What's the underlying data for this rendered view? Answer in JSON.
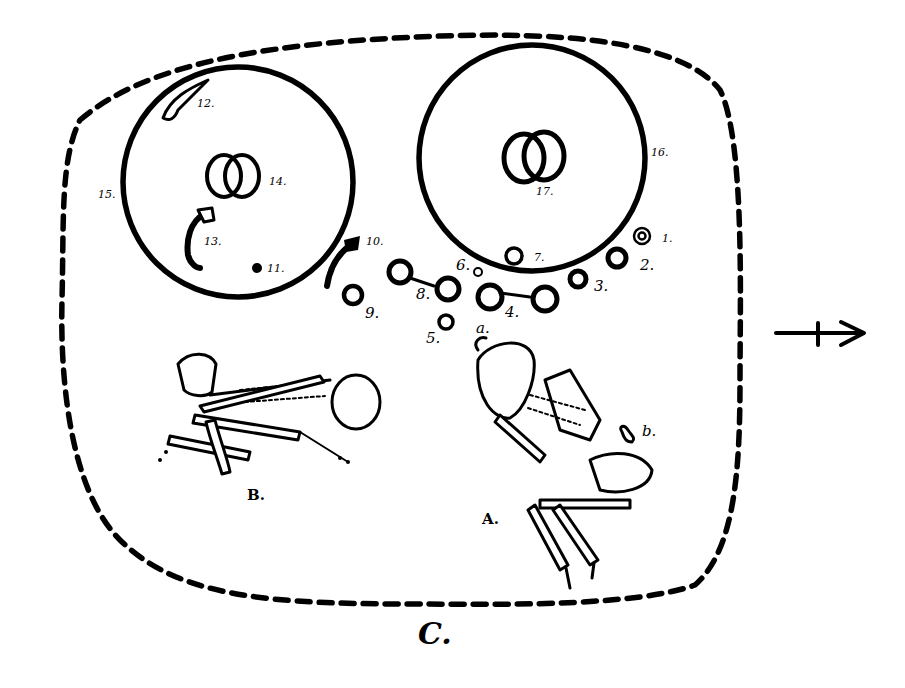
{
  "diagram": {
    "type": "archaeological burial plan",
    "colors": {
      "ink": "#000000",
      "paper": "#ffffff"
    },
    "enclosure": {
      "label": "C."
    },
    "direction_arrow": {
      "icon": "arrow-right-crossed",
      "glyph": "→"
    },
    "circles": [
      {
        "id": "15",
        "label": "15.",
        "content_label": "14.",
        "content": "interlocking rings"
      },
      {
        "id": "16",
        "label": "16.",
        "content_label": "17.",
        "content": "interlocking rings"
      }
    ],
    "finds": [
      {
        "num": "1.",
        "shape": "double ring"
      },
      {
        "num": "2.",
        "shape": "ring"
      },
      {
        "num": "3.",
        "shape": "ring"
      },
      {
        "num": "4.",
        "shape": "linked rings"
      },
      {
        "num": "5.",
        "shape": "ring"
      },
      {
        "num": "6.",
        "shape": "small ring"
      },
      {
        "num": "7.",
        "shape": "ring"
      },
      {
        "num": "8.",
        "shape": "linked rings"
      },
      {
        "num": "9.",
        "shape": "ring"
      },
      {
        "num": "10.",
        "shape": "curved object"
      },
      {
        "num": "11.",
        "shape": "small disc"
      },
      {
        "num": "12.",
        "shape": "curved object"
      },
      {
        "num": "13.",
        "shape": "curved object"
      }
    ],
    "skeletons": [
      {
        "label": "A.",
        "markers": [
          "a.",
          "b."
        ]
      },
      {
        "label": "B."
      }
    ]
  }
}
